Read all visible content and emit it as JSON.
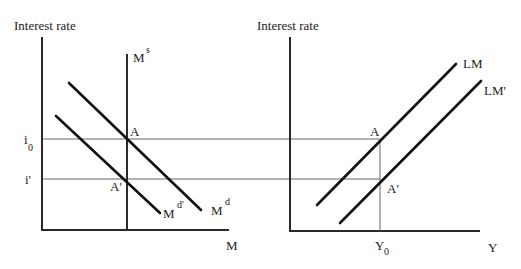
{
  "left_panel": {
    "y_axis_label": "Interest rate",
    "x_axis_label": "M",
    "money_supply_label": "M",
    "money_supply_sup": "s",
    "demand_label": "M",
    "demand_sup": "d",
    "demand_shifted_label": "M",
    "demand_shifted_sup": "d'",
    "point_a": "A",
    "point_a_prime": "A'",
    "rate_i0": "i",
    "rate_i0_sub": "0",
    "rate_i_prime": "i'"
  },
  "right_panel": {
    "y_axis_label": "Interest rate",
    "x_axis_label": "Y",
    "lm_label": "LM",
    "lm_prime_label": "LM'",
    "point_a": "A",
    "point_a_prime": "A'",
    "output_y0": "Y",
    "output_y0_sub": "0"
  }
}
